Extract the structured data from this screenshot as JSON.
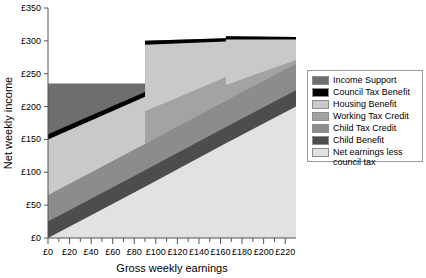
{
  "chart_data": {
    "type": "area",
    "title": "",
    "xlabel": "Gross weekly earnings",
    "ylabel": "Net weekly income",
    "xlim": [
      0,
      230
    ],
    "ylim": [
      0,
      350
    ],
    "xticks": [
      "£0",
      "£20",
      "£40",
      "£60",
      "£80",
      "£100",
      "£120",
      "£140",
      "£160",
      "£180",
      "£200",
      "£220"
    ],
    "xtick_values": [
      0,
      20,
      40,
      60,
      80,
      100,
      120,
      140,
      160,
      180,
      200,
      220
    ],
    "xminor_step": 10,
    "yticks": [
      "£0",
      "£50",
      "£100",
      "£150",
      "£200",
      "£250",
      "£300",
      "£350"
    ],
    "ytick_values": [
      0,
      50,
      100,
      150,
      200,
      250,
      300,
      350
    ],
    "grid": false,
    "legend_position": "right",
    "stack_order_bottom_to_top": [
      "Net earnings less council tax",
      "Child Benefit",
      "Child Tax Credit",
      "Working Tax Credit",
      "Housing Benefit",
      "Council Tax Benefit",
      "Income Support"
    ],
    "x": [
      0,
      90,
      90,
      165,
      165,
      230
    ],
    "series": [
      {
        "name": "Net earnings less council tax",
        "color": "#e2e2e2",
        "values": [
          0,
          78,
          78,
          144,
          144,
          200
        ],
        "cumulative_top": [
          0,
          78,
          78,
          144,
          144,
          200
        ]
      },
      {
        "name": "Child Benefit",
        "color": "#4d4d4d",
        "values": [
          25,
          25,
          25,
          25,
          25,
          25
        ],
        "cumulative_top": [
          25,
          103,
          103,
          169,
          169,
          225
        ]
      },
      {
        "name": "Child Tax Credit",
        "color": "#8c8c8c",
        "values": [
          40,
          40,
          40,
          40,
          40,
          40
        ],
        "cumulative_top": [
          65,
          143,
          143,
          209,
          209,
          265
        ]
      },
      {
        "name": "Working Tax Credit",
        "color": "#a3a3a3",
        "values": [
          0,
          0,
          50,
          36,
          24,
          6
        ],
        "cumulative_top": [
          65,
          143,
          193,
          245,
          233,
          271
        ]
      },
      {
        "name": "Housing Benefit",
        "color": "#c9c9c9",
        "values": [
          85,
          72,
          101,
          54,
          69,
          31
        ],
        "cumulative_top": [
          150,
          215,
          294,
          299,
          302,
          302
        ]
      },
      {
        "name": "Council Tax Benefit",
        "color": "#000000",
        "values": [
          8,
          7,
          6,
          5,
          5,
          4
        ],
        "cumulative_top": [
          158,
          222,
          300,
          304,
          307,
          306
        ]
      },
      {
        "name": "Income Support",
        "color": "#6e6e6e",
        "values": [
          77,
          13,
          0,
          0,
          0,
          0
        ],
        "cumulative_top": [
          235,
          235,
          300,
          304,
          307,
          306
        ]
      }
    ]
  },
  "legend": {
    "items": [
      {
        "label": "Income Support",
        "color": "#6e6e6e"
      },
      {
        "label": "Council Tax Benefit",
        "color": "#000000"
      },
      {
        "label": "Housing Benefit",
        "color": "#c9c9c9"
      },
      {
        "label": "Working Tax Credit",
        "color": "#a3a3a3"
      },
      {
        "label": "Child Tax Credit",
        "color": "#8c8c8c"
      },
      {
        "label": "Child Benefit",
        "color": "#4d4d4d"
      },
      {
        "label": "Net earnings less\ncouncil tax",
        "color": "#e2e2e2"
      }
    ]
  },
  "axes": {
    "x_title": "Gross weekly earnings",
    "y_title": "Net weekly income"
  }
}
